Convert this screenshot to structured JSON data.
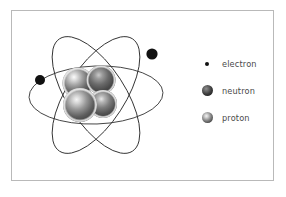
{
  "figure": {
    "background_color": "#ffffff",
    "frame_color": "#b9b9b9"
  },
  "diagram": {
    "name": "atom",
    "orbit_color": "#333333",
    "electron_color": "#111111",
    "orbits": [
      {
        "name": "orbit-1",
        "rotation_deg": -28
      },
      {
        "name": "orbit-2",
        "rotation_deg": 28
      },
      {
        "name": "orbit-3",
        "rotation_deg": 88
      }
    ],
    "electrons": [
      {
        "name": "electron-right",
        "cx": 152,
        "cy": 54,
        "r": 5.6
      },
      {
        "name": "electron-left",
        "cx": 40,
        "cy": 80,
        "r": 5.0
      }
    ],
    "nucleus": {
      "name": "nucleus",
      "nucleons": [
        {
          "name": "nucleon-upper-left",
          "type": "proton",
          "cx": 78,
          "cy": 83,
          "r": 15.5
        },
        {
          "name": "nucleon-upper-right",
          "type": "neutron",
          "cx": 101,
          "cy": 80,
          "r": 14.5
        },
        {
          "name": "nucleon-lower-right",
          "type": "proton",
          "cx": 103,
          "cy": 104,
          "r": 14.0
        },
        {
          "name": "nucleon-lower-left",
          "type": "neutron",
          "cx": 80,
          "cy": 105,
          "r": 17.0
        }
      ]
    }
  },
  "legend": {
    "name": "legend",
    "items": [
      {
        "marker": "electron-dot-icon",
        "label": "electron"
      },
      {
        "marker": "neutron-sphere-icon",
        "label": "neutron"
      },
      {
        "marker": "proton-sphere-icon",
        "label": "proton"
      }
    ]
  }
}
